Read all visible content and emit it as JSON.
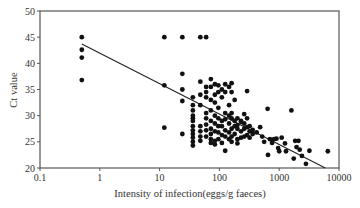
{
  "chart_data": {
    "type": "scatter",
    "title": "",
    "xlabel": "Intensity of infection(eggs/g faeces)",
    "ylabel": "Ct value",
    "xscale": "log",
    "xlim": [
      0.1,
      10000
    ],
    "ylim": [
      20,
      50
    ],
    "xticks": [
      0.1,
      1,
      10,
      100,
      1000,
      10000
    ],
    "xtick_labels": [
      "0.1",
      "1",
      "10",
      "100",
      "1000",
      "10000"
    ],
    "yticks": [
      20,
      25,
      30,
      35,
      40,
      45,
      50
    ],
    "ytick_labels": [
      "20",
      "25",
      "30",
      "35",
      "40",
      "45",
      "50"
    ],
    "grid": false,
    "legend": null,
    "regression_line": {
      "x": [
        0.5,
        5900
      ],
      "y": [
        43.7,
        20.0
      ]
    },
    "points": [
      {
        "x": 0.5,
        "y": 45.0
      },
      {
        "x": 0.5,
        "y": 42.6
      },
      {
        "x": 0.5,
        "y": 41.1
      },
      {
        "x": 0.5,
        "y": 36.8
      },
      {
        "x": 12,
        "y": 45.0
      },
      {
        "x": 24,
        "y": 45.0
      },
      {
        "x": 48,
        "y": 45.0
      },
      {
        "x": 60,
        "y": 45.0
      },
      {
        "x": 12,
        "y": 35.8
      },
      {
        "x": 12,
        "y": 27.7
      },
      {
        "x": 24,
        "y": 38.0
      },
      {
        "x": 24,
        "y": 35.0
      },
      {
        "x": 24,
        "y": 32.8
      },
      {
        "x": 24,
        "y": 26.5
      },
      {
        "x": 36,
        "y": 33.5
      },
      {
        "x": 36,
        "y": 32.0
      },
      {
        "x": 36,
        "y": 31.0
      },
      {
        "x": 36,
        "y": 30.0
      },
      {
        "x": 36,
        "y": 29.5
      },
      {
        "x": 36,
        "y": 29.0
      },
      {
        "x": 36,
        "y": 28.0
      },
      {
        "x": 36,
        "y": 27.2
      },
      {
        "x": 36,
        "y": 26.5
      },
      {
        "x": 36,
        "y": 25.8
      },
      {
        "x": 36,
        "y": 25.0
      },
      {
        "x": 36,
        "y": 24.3
      },
      {
        "x": 48,
        "y": 36.5
      },
      {
        "x": 48,
        "y": 34.0
      },
      {
        "x": 48,
        "y": 32.0
      },
      {
        "x": 48,
        "y": 28.0
      },
      {
        "x": 48,
        "y": 27.0
      },
      {
        "x": 48,
        "y": 26.0
      },
      {
        "x": 48,
        "y": 25.2
      },
      {
        "x": 60,
        "y": 35.5
      },
      {
        "x": 60,
        "y": 34.5
      },
      {
        "x": 60,
        "y": 33.5
      },
      {
        "x": 60,
        "y": 30.5
      },
      {
        "x": 60,
        "y": 29.5
      },
      {
        "x": 60,
        "y": 28.3
      },
      {
        "x": 60,
        "y": 27.2
      },
      {
        "x": 60,
        "y": 26.0
      },
      {
        "x": 72,
        "y": 37.0
      },
      {
        "x": 72,
        "y": 35.5
      },
      {
        "x": 72,
        "y": 33.0
      },
      {
        "x": 72,
        "y": 31.0
      },
      {
        "x": 72,
        "y": 29.0
      },
      {
        "x": 72,
        "y": 27.5
      },
      {
        "x": 72,
        "y": 26.5
      },
      {
        "x": 72,
        "y": 25.5
      },
      {
        "x": 72,
        "y": 24.8
      },
      {
        "x": 84,
        "y": 36.0
      },
      {
        "x": 84,
        "y": 34.0
      },
      {
        "x": 84,
        "y": 32.5
      },
      {
        "x": 84,
        "y": 30.0
      },
      {
        "x": 84,
        "y": 28.5
      },
      {
        "x": 84,
        "y": 27.0
      },
      {
        "x": 84,
        "y": 25.2
      },
      {
        "x": 84,
        "y": 24.5
      },
      {
        "x": 96,
        "y": 35.8
      },
      {
        "x": 96,
        "y": 34.5
      },
      {
        "x": 96,
        "y": 31.5
      },
      {
        "x": 96,
        "y": 29.5
      },
      {
        "x": 96,
        "y": 28.0
      },
      {
        "x": 96,
        "y": 26.8
      },
      {
        "x": 96,
        "y": 25.5
      },
      {
        "x": 110,
        "y": 35.0
      },
      {
        "x": 110,
        "y": 33.5
      },
      {
        "x": 110,
        "y": 29.0
      },
      {
        "x": 110,
        "y": 28.0
      },
      {
        "x": 110,
        "y": 26.3
      },
      {
        "x": 110,
        "y": 24.8
      },
      {
        "x": 125,
        "y": 36.0
      },
      {
        "x": 125,
        "y": 34.5
      },
      {
        "x": 125,
        "y": 30.5
      },
      {
        "x": 125,
        "y": 29.3
      },
      {
        "x": 125,
        "y": 27.2
      },
      {
        "x": 125,
        "y": 26.0
      },
      {
        "x": 125,
        "y": 23.3
      },
      {
        "x": 145,
        "y": 35.5
      },
      {
        "x": 145,
        "y": 32.0
      },
      {
        "x": 145,
        "y": 30.0
      },
      {
        "x": 145,
        "y": 28.5
      },
      {
        "x": 145,
        "y": 26.8
      },
      {
        "x": 145,
        "y": 25.5
      },
      {
        "x": 160,
        "y": 36.2
      },
      {
        "x": 160,
        "y": 34.5
      },
      {
        "x": 160,
        "y": 30.5
      },
      {
        "x": 160,
        "y": 29.5
      },
      {
        "x": 160,
        "y": 27.5
      },
      {
        "x": 160,
        "y": 26.0
      },
      {
        "x": 160,
        "y": 25.0
      },
      {
        "x": 180,
        "y": 33.0
      },
      {
        "x": 180,
        "y": 29.0
      },
      {
        "x": 180,
        "y": 28.0
      },
      {
        "x": 180,
        "y": 26.5
      },
      {
        "x": 200,
        "y": 29.5
      },
      {
        "x": 200,
        "y": 28.2
      },
      {
        "x": 200,
        "y": 27.5
      },
      {
        "x": 200,
        "y": 25.5
      },
      {
        "x": 200,
        "y": 24.7
      },
      {
        "x": 230,
        "y": 29.0
      },
      {
        "x": 230,
        "y": 28.8
      },
      {
        "x": 230,
        "y": 27.0
      },
      {
        "x": 230,
        "y": 25.8
      },
      {
        "x": 260,
        "y": 30.3
      },
      {
        "x": 260,
        "y": 28.5
      },
      {
        "x": 260,
        "y": 27.5
      },
      {
        "x": 260,
        "y": 26.0
      },
      {
        "x": 290,
        "y": 34.7
      },
      {
        "x": 290,
        "y": 29.5
      },
      {
        "x": 290,
        "y": 27.8
      },
      {
        "x": 290,
        "y": 26.3
      },
      {
        "x": 320,
        "y": 28.0
      },
      {
        "x": 320,
        "y": 27.0
      },
      {
        "x": 320,
        "y": 25.8
      },
      {
        "x": 360,
        "y": 27.3
      },
      {
        "x": 360,
        "y": 26.5
      },
      {
        "x": 420,
        "y": 26.8
      },
      {
        "x": 480,
        "y": 27.8
      },
      {
        "x": 520,
        "y": 26.0
      },
      {
        "x": 560,
        "y": 25.0
      },
      {
        "x": 640,
        "y": 31.3
      },
      {
        "x": 650,
        "y": 22.5
      },
      {
        "x": 700,
        "y": 25.5
      },
      {
        "x": 760,
        "y": 24.8
      },
      {
        "x": 820,
        "y": 25.5
      },
      {
        "x": 900,
        "y": 25.6
      },
      {
        "x": 960,
        "y": 23.8
      },
      {
        "x": 1000,
        "y": 23.2
      },
      {
        "x": 1100,
        "y": 25.8
      },
      {
        "x": 1250,
        "y": 24.7
      },
      {
        "x": 1300,
        "y": 23.2
      },
      {
        "x": 1600,
        "y": 31.0
      },
      {
        "x": 1750,
        "y": 21.8
      },
      {
        "x": 1850,
        "y": 25.2
      },
      {
        "x": 1950,
        "y": 24.0
      },
      {
        "x": 2100,
        "y": 25.2
      },
      {
        "x": 2200,
        "y": 23.5
      },
      {
        "x": 2400,
        "y": 22.3
      },
      {
        "x": 2800,
        "y": 20.8
      },
      {
        "x": 3200,
        "y": 23.3
      },
      {
        "x": 6500,
        "y": 23.2
      }
    ]
  }
}
